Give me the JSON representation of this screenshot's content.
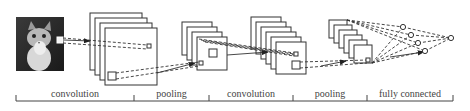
{
  "diagram": {
    "input": {
      "label": "cat-image",
      "x": 16,
      "y": 17,
      "w": 48,
      "h": 54
    },
    "stages": [
      {
        "label": "convolution",
        "start": 16,
        "end": 134
      },
      {
        "label": "pooling",
        "start": 134,
        "end": 209
      },
      {
        "label": "convolution",
        "start": 209,
        "end": 293
      },
      {
        "label": "pooling",
        "start": 293,
        "end": 367
      },
      {
        "label": "fully connected",
        "start": 367,
        "end": 453
      }
    ],
    "layers": [
      {
        "name": "conv1",
        "count": 4,
        "x": 90,
        "y": 13,
        "size": 52,
        "h": 57,
        "dx": 5,
        "dy": 5
      },
      {
        "name": "pool1",
        "count": 4,
        "x": 182,
        "y": 22,
        "size": 30,
        "h": 33,
        "dx": 5,
        "dy": 5
      },
      {
        "name": "conv2",
        "count": 6,
        "x": 251,
        "y": 17,
        "size": 30,
        "h": 32,
        "dx": 5,
        "dy": 5
      },
      {
        "name": "pool2",
        "count": 6,
        "x": 329,
        "y": 20,
        "size": 18,
        "h": 18,
        "dx": 5,
        "dy": 5
      }
    ],
    "fc_nodes": [
      {
        "x": 403,
        "y": 27
      },
      {
        "x": 411,
        "y": 35
      },
      {
        "x": 418,
        "y": 43
      },
      {
        "x": 425,
        "y": 51
      }
    ],
    "output_node": {
      "x": 451,
      "y": 38
    },
    "colors": {
      "line": "#333333",
      "bracket": "#444444",
      "text": "#444444"
    }
  }
}
